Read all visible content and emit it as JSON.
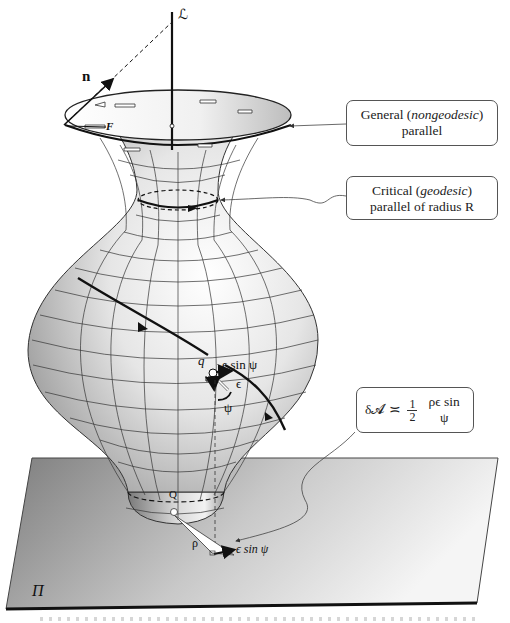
{
  "figure": {
    "type": "surface-of-revolution-diagram",
    "axis_label": "ℒ",
    "normal_label": "n",
    "force_label": "F",
    "plane_label": "Π",
    "surface_point_label": "q",
    "projected_point_label": "Q",
    "angle_label": "ψ",
    "displacement_label": "ϵ",
    "component_label": "ϵ sin ψ",
    "projected_component_label": "ϵ sin ψ",
    "radius_label": "ρ"
  },
  "callouts": [
    {
      "id": "general-parallel",
      "line1_prefix": "General (",
      "line1_italic": "nongeodesic",
      "line1_suffix": ")",
      "line2": "parallel"
    },
    {
      "id": "critical-parallel",
      "line1_prefix": "Critical (",
      "line1_italic": "geodesic",
      "line1_suffix": ")",
      "line2": "parallel of radius R"
    },
    {
      "id": "area-formula",
      "lhs": "δ𝓐",
      "relation": "≍",
      "frac_num": "1",
      "frac_den": "2",
      "rhs": "ρϵ sin ψ"
    }
  ],
  "colors": {
    "background": "#ffffff",
    "surface_light": "#f4f4f4",
    "surface_dark": "#8a8a8a",
    "plane_dark": "#7e7e7e",
    "plane_light": "#f2f2f2",
    "ink": "#111111"
  }
}
